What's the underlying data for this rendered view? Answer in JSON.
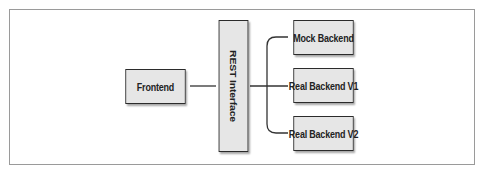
{
  "diagram": {
    "nodes": {
      "frontend": {
        "label": "Frontend"
      },
      "rest": {
        "label": "REST Interface"
      },
      "mock": {
        "label": "Mock Backend"
      },
      "real_v1": {
        "label": "Real Backend V1"
      },
      "real_v2": {
        "label": "Real Backend V2"
      }
    },
    "edges": [
      {
        "from": "Frontend",
        "to": "REST Interface"
      },
      {
        "from": "REST Interface",
        "to": "Mock Backend"
      },
      {
        "from": "REST Interface",
        "to": "Real Backend V1"
      },
      {
        "from": "REST Interface",
        "to": "Real Backend V2"
      }
    ],
    "colors": {
      "box_fill": "#e6e6e6",
      "box_border": "#2b2b2b",
      "line": "#333333",
      "frame": "#9a9a9a"
    }
  }
}
